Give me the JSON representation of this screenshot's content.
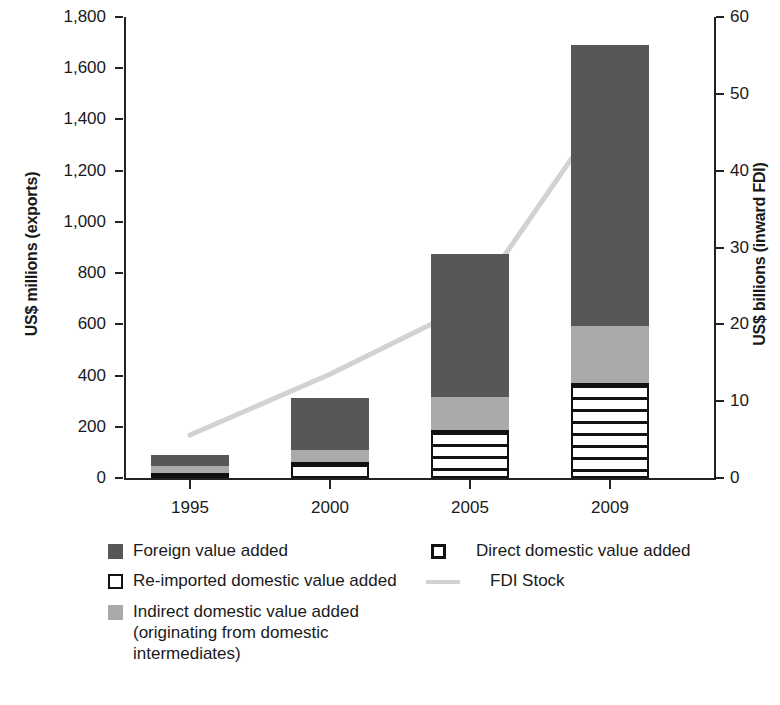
{
  "chart_data": {
    "type": "bar",
    "title": "",
    "subtitle": "",
    "categories": [
      "1995",
      "2000",
      "2005",
      "2009"
    ],
    "stacked": true,
    "stack_order_bottom_to_top": [
      "Direct domestic value added",
      "Re-imported domestic value added",
      "Indirect domestic value added (originating from domestic intermediates)",
      "Foreign value added"
    ],
    "series": [
      {
        "name": "Direct domestic value added",
        "axis": "left",
        "values": [
          20,
          62,
          187,
          371
        ]
      },
      {
        "name": "Re-imported domestic value added",
        "axis": "left",
        "values": [
          0,
          0,
          0,
          0
        ]
      },
      {
        "name": "Indirect domestic value added (originating from domestic intermediates)",
        "axis": "left",
        "values": [
          27,
          47,
          129,
          223
        ]
      },
      {
        "name": "Foreign value added",
        "axis": "left",
        "values": [
          43,
          203,
          559,
          1097
        ]
      },
      {
        "name": "FDI Stock",
        "axis": "right",
        "type": "line",
        "values": [
          5.6,
          13.5,
          22.5,
          48.8
        ]
      }
    ],
    "totals_left_axis": [
      90,
      312,
      875,
      1691
    ],
    "xlabel": "",
    "ylabel": "US$ millions (exports)",
    "y2label": "US$ billions (inward FDI)",
    "ylim": [
      0,
      1800
    ],
    "y2lim": [
      0,
      60
    ],
    "yticks": [
      "0",
      "200",
      "400",
      "600",
      "800",
      "1,000",
      "1,200",
      "1,400",
      "1,600",
      "1,800"
    ],
    "y2ticks": [
      "0",
      "10",
      "20",
      "30",
      "40",
      "50",
      "60"
    ],
    "grid": false,
    "legend_position": "below-plot",
    "colors": {
      "foreign_value_added": "#575757",
      "indirect_domestic_value_added": "#aaaaaa",
      "re_imported_domestic_value_added": "#ffffff",
      "direct_domestic_value_added": "#ffffff",
      "fdi_stock_line": "#d2d2d2",
      "axis": "#222222",
      "text": "#1a1a1a"
    }
  },
  "axes": {
    "left": {
      "title": "US$ millions (exports)",
      "ticks": [
        "1,800",
        "1,600",
        "1,400",
        "1,200",
        "1,000",
        "800",
        "600",
        "400",
        "200",
        "0"
      ]
    },
    "right": {
      "title": "US$ billions (inward FDI)",
      "ticks": [
        "60",
        "50",
        "40",
        "30",
        "20",
        "10",
        "0"
      ]
    },
    "x": {
      "ticks": [
        "1995",
        "2000",
        "2005",
        "2009"
      ]
    }
  },
  "legend": {
    "column_a": [
      {
        "swatch": "dark-gray-square-icon",
        "label": "Foreign value added"
      },
      {
        "swatch": "white-outline-square-icon",
        "label": "Re-imported domestic value added"
      },
      {
        "swatch": "light-gray-square-icon",
        "label": "Indirect domestic value added (originating from domestic intermediates)"
      }
    ],
    "column_b": [
      {
        "swatch": "striped-square-icon",
        "label": "Direct domestic value added"
      },
      {
        "swatch": "gray-line-icon",
        "label": "FDI Stock"
      }
    ]
  }
}
